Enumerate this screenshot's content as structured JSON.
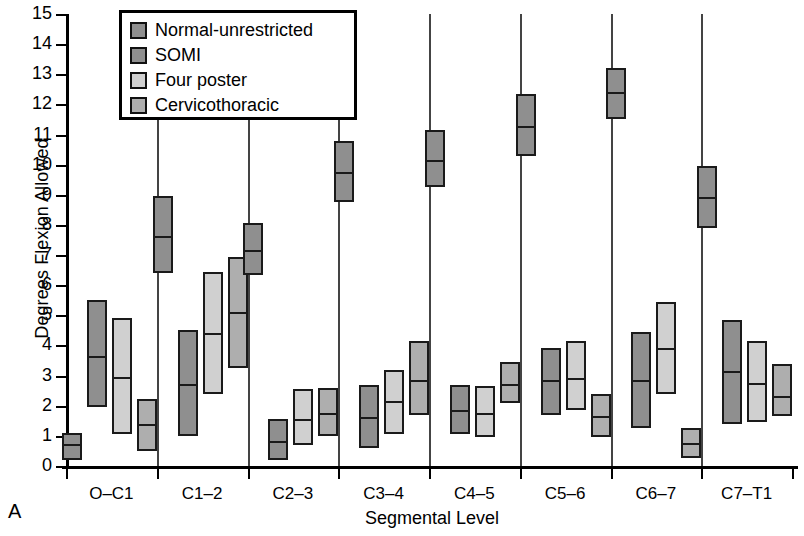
{
  "panel_label": "A",
  "chart_data": {
    "type": "bar",
    "title": "",
    "xlabel": "Segmental Level",
    "ylabel": "Degrees Flexion Allowed",
    "ylim": [
      0,
      15
    ],
    "yticks": [
      15,
      14,
      13,
      12,
      11,
      10,
      9,
      8,
      7,
      6,
      5,
      4,
      3,
      2,
      1,
      0
    ],
    "grid": false,
    "legend_position": "top-left",
    "categories": [
      "O–C1",
      "C1–2",
      "C2–3",
      "C3–4",
      "C4–5",
      "C5–6",
      "C6–7",
      "C7–T1"
    ],
    "series": [
      {
        "name": "Normal-unrestricted",
        "color": "#8f8f8f",
        "low": [
          0.2,
          6.4,
          6.35,
          8.75,
          9.25,
          10.3,
          11.5,
          7.9
        ],
        "mean": [
          0.75,
          7.65,
          7.2,
          9.8,
          10.2,
          11.3,
          12.45,
          8.95
        ],
        "high": [
          1.1,
          8.95,
          8.05,
          10.8,
          11.15,
          12.35,
          13.2,
          9.95
        ]
      },
      {
        "name": "SOMI",
        "color": "#8f8f8f",
        "low": [
          1.95,
          1.0,
          0.2,
          0.6,
          1.05,
          1.7,
          1.25,
          1.4
        ],
        "mean": [
          3.7,
          2.75,
          0.85,
          1.65,
          1.9,
          2.9,
          2.9,
          3.2
        ],
        "high": [
          5.5,
          4.5,
          1.55,
          2.7,
          2.7,
          3.9,
          4.45,
          4.85
        ]
      },
      {
        "name": "Four poster",
        "color": "#d0d0d0",
        "low": [
          1.05,
          2.4,
          0.7,
          1.05,
          0.95,
          1.85,
          2.4,
          1.45
        ],
        "mean": [
          2.98,
          4.45,
          1.6,
          2.2,
          1.8,
          2.95,
          3.95,
          2.8
        ],
        "high": [
          4.9,
          6.45,
          2.55,
          3.2,
          2.65,
          4.15,
          5.45,
          4.15
        ]
      },
      {
        "name": "Cervicothoracic",
        "color": "#aeaeae",
        "low": [
          0.5,
          3.25,
          1.0,
          1.7,
          2.1,
          0.95,
          0.25,
          1.65
        ],
        "mean": [
          1.42,
          5.15,
          1.8,
          2.9,
          2.75,
          1.7,
          0.8,
          2.35
        ],
        "high": [
          2.22,
          6.95,
          2.6,
          4.15,
          3.45,
          2.4,
          1.25,
          3.4
        ]
      }
    ]
  }
}
